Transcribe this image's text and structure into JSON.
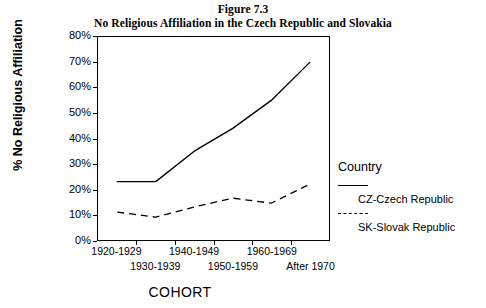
{
  "figure": {
    "number": "Figure 7.3",
    "title": "No Religious Affiliation in the Czech Republic and Slovakia"
  },
  "axes": {
    "ylabel": "% No Religious Affiliation",
    "xlabel": "COHORT",
    "yticks": [
      "80%",
      "70%",
      "60%",
      "50%",
      "40%",
      "30%",
      "20%",
      "10%",
      "0%"
    ],
    "xticks": [
      "1920-1929",
      "1930-1939",
      "1940-1949",
      "1950-1959",
      "1960-1969",
      "After 1970"
    ]
  },
  "legend": {
    "title": "Country",
    "entries": [
      {
        "label": "CZ-Czech Republic",
        "style": "solid"
      },
      {
        "label": "SK-Slovak Republic",
        "style": "dashed"
      }
    ]
  },
  "colors": {
    "line": "#000000",
    "background": "#ffffff",
    "axis": "#000000"
  },
  "chart_data": {
    "type": "line",
    "title": "No Religious Affiliation in the Czech Republic and Slovakia",
    "subtitle": "Figure 7.3",
    "xlabel": "COHORT",
    "ylabel": "% No Religious Affiliation",
    "categories": [
      "1920-1929",
      "1930-1939",
      "1940-1949",
      "1950-1959",
      "1960-1969",
      "After 1970"
    ],
    "series": [
      {
        "name": "CZ-Czech Republic",
        "style": "solid",
        "values": [
          23,
          23,
          35,
          44,
          55,
          70
        ]
      },
      {
        "name": "SK-Slovak Republic",
        "style": "dashed",
        "values": [
          11,
          9,
          13,
          16.5,
          14.5,
          22
        ]
      }
    ],
    "ylim": [
      0,
      80
    ],
    "ytick_step": 10,
    "grid": false,
    "legend_position": "right",
    "units": "percent"
  }
}
